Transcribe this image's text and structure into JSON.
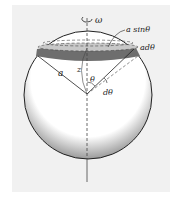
{
  "diagram": {
    "labels": {
      "omega": "ω",
      "ring_radius": "a sinθ",
      "ring_width": "adθ",
      "radius": "a",
      "axis": "z",
      "angle": "θ",
      "dangle": "dθ"
    },
    "colors": {
      "background": "#f1f1f1",
      "sphere_fill": "#ffffff",
      "sphere_shade": "#9a9a9a",
      "band_fill": "#6e6e6e",
      "band_top": "#c8c8c8",
      "outline": "#222222"
    }
  }
}
